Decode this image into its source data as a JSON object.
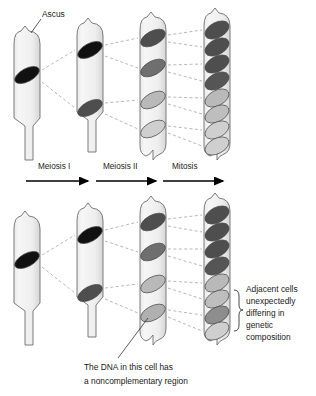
{
  "figure": {
    "title_label": "Ascus",
    "stages": [
      {
        "name": "meiosis-i",
        "label": "Meiosis I",
        "x": 38,
        "y": 167,
        "arrow_x1": 26,
        "arrow_x2": 90
      },
      {
        "name": "meiosis-ii",
        "label": "Meiosis II",
        "x": 103,
        "y": 167,
        "arrow_x1": 96,
        "arrow_x2": 158
      },
      {
        "name": "mitosis",
        "label": "Mitosis",
        "x": 172,
        "y": 167,
        "arrow_x1": 163,
        "arrow_x2": 225
      }
    ],
    "ascus_label": {
      "text": "Ascus",
      "x": 42,
      "y": 15
    },
    "bracket_note": {
      "lines": [
        "Adjacent cells",
        "unexpectedly",
        "differing in",
        "genetic",
        "composition"
      ],
      "x": 246,
      "y": 287
    },
    "bottom_note": {
      "lines": [
        "The DNA in this cell has",
        "a noncomplementary region"
      ],
      "x": 84,
      "y": 368
    },
    "colors": {
      "nucleus_black": "#111111",
      "nucleus_dark": "#4e4e4e",
      "nucleus_mid": "#6f6f6f",
      "nucleus_light": "#b9b9b9",
      "nucleus_pale": "#cfcfcf",
      "ascus_fill_light": "#f4f4f4",
      "ascus_fill_shade": "#d9d9d9",
      "ascus_stroke": "#6e6e6e",
      "dash_line": "#9a9a9a",
      "text": "#1a1a1a"
    },
    "rows": [
      {
        "name": "top-row",
        "asci": [
          {
            "name": "ascus-1-zygote",
            "x": 14,
            "top": 30,
            "bottom": 160,
            "width": 26,
            "nuclei": [
              {
                "cy": 75,
                "shade": "nucleus_black",
                "angle": -28
              }
            ]
          },
          {
            "name": "ascus-2-meiosis-i",
            "x": 77,
            "top": 22,
            "bottom": 152,
            "width": 26,
            "nuclei": [
              {
                "cy": 50,
                "shade": "nucleus_black",
                "angle": -28
              },
              {
                "cy": 108,
                "shade": "nucleus_dark",
                "angle": -28
              }
            ]
          },
          {
            "name": "ascus-3-meiosis-ii",
            "x": 140,
            "top": 16,
            "bottom": 155,
            "width": 26,
            "nuclei": [
              {
                "cy": 38,
                "shade": "nucleus_dark",
                "angle": -28
              },
              {
                "cy": 68,
                "shade": "nucleus_mid",
                "angle": -28
              },
              {
                "cy": 100,
                "shade": "nucleus_light",
                "angle": -28
              },
              {
                "cy": 129,
                "shade": "nucleus_pale",
                "angle": -28
              }
            ]
          },
          {
            "name": "ascus-4-mitosis",
            "x": 204,
            "top": 12,
            "bottom": 155,
            "width": 26,
            "nuclei": [
              {
                "cy": 30,
                "shade": "nucleus_dark",
                "angle": -28
              },
              {
                "cy": 47,
                "shade": "nucleus_dark",
                "angle": -28
              },
              {
                "cy": 64,
                "shade": "nucleus_dark",
                "angle": -28
              },
              {
                "cy": 81,
                "shade": "nucleus_dark",
                "angle": -28
              },
              {
                "cy": 98,
                "shade": "nucleus_light",
                "angle": -28
              },
              {
                "cy": 114,
                "shade": "nucleus_light",
                "angle": -28
              },
              {
                "cy": 130,
                "shade": "nucleus_pale",
                "angle": -28
              },
              {
                "cy": 146,
                "shade": "nucleus_pale",
                "angle": -28
              }
            ]
          }
        ]
      },
      {
        "name": "bottom-row",
        "asci": [
          {
            "name": "ascus-1-zygote",
            "x": 14,
            "top": 215,
            "bottom": 345,
            "width": 26,
            "nuclei": [
              {
                "cy": 260,
                "shade": "nucleus_black",
                "angle": -28
              }
            ]
          },
          {
            "name": "ascus-2-meiosis-i",
            "x": 77,
            "top": 207,
            "bottom": 337,
            "width": 26,
            "nuclei": [
              {
                "cy": 235,
                "shade": "nucleus_black",
                "angle": -28
              },
              {
                "cy": 293,
                "shade": "nucleus_dark",
                "angle": -28
              }
            ]
          },
          {
            "name": "ascus-3-meiosis-ii",
            "x": 140,
            "top": 200,
            "bottom": 340,
            "width": 26,
            "nuclei": [
              {
                "cy": 222,
                "shade": "nucleus_dark",
                "angle": -28
              },
              {
                "cy": 252,
                "shade": "nucleus_mid",
                "angle": -28
              },
              {
                "cy": 284,
                "shade": "nucleus_light",
                "angle": -28
              },
              {
                "cy": 313,
                "shade": "nucleus_light",
                "angle": -28,
                "marked": true
              }
            ]
          },
          {
            "name": "ascus-4-mitosis",
            "x": 204,
            "top": 197,
            "bottom": 340,
            "width": 26,
            "nuclei": [
              {
                "cy": 215,
                "shade": "nucleus_dark",
                "angle": -28
              },
              {
                "cy": 232,
                "shade": "nucleus_dark",
                "angle": -28
              },
              {
                "cy": 249,
                "shade": "nucleus_dark",
                "angle": -28
              },
              {
                "cy": 266,
                "shade": "nucleus_dark",
                "angle": -28
              },
              {
                "cy": 283,
                "shade": "nucleus_light",
                "angle": -28
              },
              {
                "cy": 299,
                "shade": "nucleus_light",
                "angle": -28
              },
              {
                "cy": 315,
                "shade": "nucleus_mid",
                "angle": -28
              },
              {
                "cy": 331,
                "shade": "nucleus_pale",
                "angle": -28
              }
            ]
          }
        ]
      }
    ]
  }
}
